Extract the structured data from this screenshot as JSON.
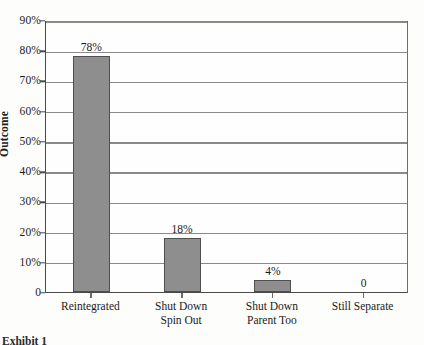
{
  "chart_data": {
    "type": "bar",
    "title": "",
    "xlabel": "",
    "ylabel": "Outcome",
    "ylim": [
      0,
      90
    ],
    "grid": true,
    "legend": "none",
    "categories": [
      "Reintegrated",
      "Shut Down Spin Out",
      "Shut Down Parent Too",
      "Still Separate"
    ],
    "category_lines": [
      [
        "Reintegrated",
        ""
      ],
      [
        "Shut Down",
        "Spin Out"
      ],
      [
        "Shut Down",
        "Parent Too"
      ],
      [
        "Still Separate",
        ""
      ]
    ],
    "values": [
      78,
      18,
      4,
      0
    ],
    "data_labels": [
      "78%",
      "18%",
      "4%",
      "0"
    ],
    "y_ticks": [
      0,
      10,
      20,
      30,
      40,
      50,
      60,
      70,
      80,
      90
    ],
    "y_tick_labels": [
      "0",
      "10%",
      "20%",
      "30%",
      "40%",
      "50%",
      "60%",
      "70%",
      "80%",
      "90%"
    ]
  },
  "caption": {
    "text": "Exhibit 1"
  },
  "colors": {
    "bar_fill": "#8e8e8e",
    "bar_edge": "#4f4f4f",
    "gridline": "#8a8a8a",
    "axis": "#4a4a4a",
    "text": "#1b1b1b",
    "background": "#fdfdfb"
  }
}
